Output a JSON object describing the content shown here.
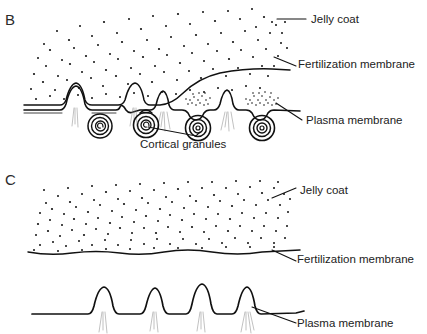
{
  "figure": {
    "panels": [
      {
        "letter": "B",
        "caption": "Cortical granules fusing with the plasma membrane; fertilization membrane begins to lift away from the egg surface",
        "labels": [
          {
            "id": "jelly-coat",
            "text": "Jelly coat"
          },
          {
            "id": "fertilization-membrane",
            "text": "Fertilization membrane"
          },
          {
            "id": "plasma-membrane",
            "text": "Plasma membrane"
          },
          {
            "id": "cortical-granules",
            "text": "Cortical granules"
          }
        ]
      },
      {
        "letter": "C",
        "caption": "Fully elevated fertilization membrane separated from the plasma membrane, which retains its microvilli",
        "labels": [
          {
            "id": "jelly-coat",
            "text": "Jelly coat"
          },
          {
            "id": "fertilization-membrane",
            "text": "Fertilization membrane"
          },
          {
            "id": "plasma-membrane",
            "text": "Plasma membrane"
          }
        ]
      }
    ],
    "colors": {
      "ink": "#111111",
      "background": "#ffffff",
      "hairline": "#8d8d8d",
      "text": "#222222"
    }
  }
}
